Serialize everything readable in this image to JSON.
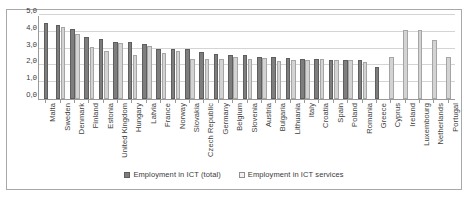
{
  "chart_data": {
    "type": "bar",
    "title": "",
    "xlabel": "",
    "ylabel": "",
    "ylim": [
      0,
      5
    ],
    "ytick_labels": [
      "0,0",
      "1,0",
      "2,0",
      "3,0",
      "4,0",
      "5,0"
    ],
    "ytick_values": [
      0,
      1,
      2,
      3,
      4,
      5
    ],
    "grid": true,
    "legend_position": "bottom",
    "categories": [
      "Malta",
      "Sweden",
      "Denmark",
      "Finland",
      "Estonia",
      "United Kingdom",
      "Hungary",
      "Latvia",
      "France",
      "Norway",
      "Slovakia",
      "Czech Republic",
      "Germany",
      "Belgium",
      "Slovenia",
      "Austria",
      "Bulgaria",
      "Lithuania",
      "Italy",
      "Croatia",
      "Spain",
      "Poland",
      "Romania",
      "Greece",
      "Cyprus",
      "Ireland",
      "Luxembourg",
      "Netherlands",
      "Portugal"
    ],
    "series": [
      {
        "name": "Employment in ICT (total)",
        "color": "#7e7e7e",
        "values": [
          4.5,
          4.4,
          4.15,
          3.7,
          3.55,
          3.4,
          3.4,
          3.25,
          3.0,
          2.95,
          2.95,
          2.8,
          2.65,
          2.6,
          2.6,
          2.5,
          2.5,
          2.45,
          2.4,
          2.4,
          2.35,
          2.35,
          2.3,
          1.9,
          null,
          null,
          null,
          null,
          null
        ]
      },
      {
        "name": "Employment in ICT services",
        "color": "#d3d3d3",
        "values": [
          null,
          4.3,
          3.85,
          3.1,
          2.85,
          3.35,
          2.6,
          3.15,
          2.75,
          2.85,
          2.4,
          2.4,
          2.4,
          2.5,
          2.4,
          2.45,
          2.25,
          2.35,
          2.3,
          2.4,
          2.3,
          2.3,
          2.2,
          null,
          2.5,
          4.1,
          4.1,
          3.5,
          2.5
        ]
      }
    ]
  },
  "legend": {
    "items": [
      {
        "label": "Employment in ICT (total)",
        "swatch": "total"
      },
      {
        "label": "Employment in ICT services",
        "swatch": "services"
      }
    ]
  }
}
